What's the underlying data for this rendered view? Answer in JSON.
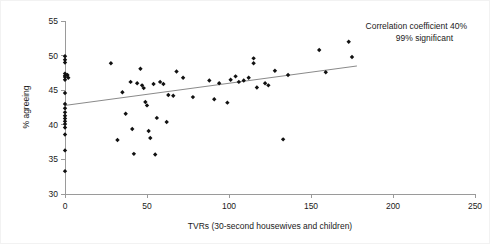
{
  "chart_data": {
    "type": "scatter",
    "title": "",
    "xlabel": "TVRs (30-second housewives and children)",
    "ylabel": "% agreeing",
    "xlim": [
      0,
      250
    ],
    "ylim": [
      30,
      55
    ],
    "xticks": [
      0,
      50,
      100,
      150,
      200,
      250
    ],
    "yticks": [
      30,
      35,
      40,
      45,
      50,
      55
    ],
    "xtick_labels": [
      "0",
      "50",
      "100",
      "150",
      "200",
      "250"
    ],
    "ytick_labels": [
      "30",
      "35",
      "40",
      "45",
      "50",
      "55"
    ],
    "grid": false,
    "legend": false,
    "annotations": [
      "Correlation coefficient 40%",
      "99% significant"
    ],
    "correlation_coefficient": "40%",
    "significance": "99% significant",
    "marker": "diamond",
    "marker_color": "#111111",
    "trend_line": {
      "visible": true,
      "color": "#8a8a8a",
      "x_start": 0,
      "y_start": 42.8,
      "x_end": 178,
      "y_end": 48.5
    },
    "points": [
      {
        "x": 0,
        "y": 49.9
      },
      {
        "x": 0,
        "y": 49.4
      },
      {
        "x": 0,
        "y": 49.0
      },
      {
        "x": 0,
        "y": 47.4
      },
      {
        "x": 0,
        "y": 47.1
      },
      {
        "x": 0,
        "y": 46.9
      },
      {
        "x": 1.5,
        "y": 47.2
      },
      {
        "x": 2.0,
        "y": 46.8
      },
      {
        "x": 0,
        "y": 46.5
      },
      {
        "x": 0,
        "y": 44.6
      },
      {
        "x": 0,
        "y": 43.0
      },
      {
        "x": 0,
        "y": 42.4
      },
      {
        "x": 0,
        "y": 41.8
      },
      {
        "x": 0,
        "y": 41.3
      },
      {
        "x": 0,
        "y": 40.9
      },
      {
        "x": 0,
        "y": 40.5
      },
      {
        "x": 0,
        "y": 40.1
      },
      {
        "x": 0,
        "y": 39.6
      },
      {
        "x": 0,
        "y": 38.6
      },
      {
        "x": 0,
        "y": 36.3
      },
      {
        "x": 0,
        "y": 33.3
      },
      {
        "x": 28,
        "y": 48.9
      },
      {
        "x": 32,
        "y": 37.8
      },
      {
        "x": 35,
        "y": 44.7
      },
      {
        "x": 37,
        "y": 41.6
      },
      {
        "x": 40,
        "y": 46.2
      },
      {
        "x": 41,
        "y": 39.4
      },
      {
        "x": 42,
        "y": 35.8
      },
      {
        "x": 44,
        "y": 46.0
      },
      {
        "x": 46,
        "y": 48.1
      },
      {
        "x": 47,
        "y": 45.7
      },
      {
        "x": 48,
        "y": 45.3
      },
      {
        "x": 49,
        "y": 43.3
      },
      {
        "x": 50,
        "y": 42.8
      },
      {
        "x": 51,
        "y": 39.1
      },
      {
        "x": 52,
        "y": 38.1
      },
      {
        "x": 54,
        "y": 45.9
      },
      {
        "x": 55,
        "y": 35.7
      },
      {
        "x": 56,
        "y": 41.0
      },
      {
        "x": 58,
        "y": 46.2
      },
      {
        "x": 60,
        "y": 45.9
      },
      {
        "x": 62,
        "y": 40.4
      },
      {
        "x": 63,
        "y": 44.3
      },
      {
        "x": 66,
        "y": 44.2
      },
      {
        "x": 68,
        "y": 47.7
      },
      {
        "x": 72,
        "y": 46.8
      },
      {
        "x": 78,
        "y": 44.0
      },
      {
        "x": 88,
        "y": 46.4
      },
      {
        "x": 91,
        "y": 43.7
      },
      {
        "x": 94,
        "y": 46.0
      },
      {
        "x": 99,
        "y": 43.2
      },
      {
        "x": 101,
        "y": 46.5
      },
      {
        "x": 104,
        "y": 47.0
      },
      {
        "x": 106,
        "y": 46.2
      },
      {
        "x": 109,
        "y": 46.4
      },
      {
        "x": 112,
        "y": 46.8
      },
      {
        "x": 115,
        "y": 49.6
      },
      {
        "x": 115,
        "y": 48.9
      },
      {
        "x": 117,
        "y": 45.4
      },
      {
        "x": 122,
        "y": 46.0
      },
      {
        "x": 124,
        "y": 45.7
      },
      {
        "x": 128,
        "y": 47.8
      },
      {
        "x": 133,
        "y": 37.9
      },
      {
        "x": 136,
        "y": 47.2
      },
      {
        "x": 155,
        "y": 50.8
      },
      {
        "x": 159,
        "y": 47.6
      },
      {
        "x": 173,
        "y": 52.0
      },
      {
        "x": 175,
        "y": 49.8
      }
    ]
  }
}
